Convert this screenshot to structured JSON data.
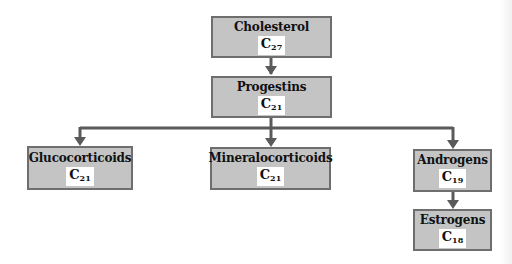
{
  "diagram": {
    "type": "steroid-hormone-biosynthesis-hierarchy",
    "colors": {
      "box_fill": "#c4c4c4",
      "box_border": "#6e6e6e",
      "arrow": "#5a5a5a",
      "formula_bg": "#ffffff"
    },
    "nodes": [
      {
        "id": "cholesterol",
        "name": "Cholesterol",
        "formula_letter": "C",
        "carbon_count": "27"
      },
      {
        "id": "progestins",
        "name": "Progestins",
        "formula_letter": "C",
        "carbon_count": "21"
      },
      {
        "id": "glucocorticoids",
        "name": "Glucocorticoids",
        "formula_letter": "C",
        "carbon_count": "21"
      },
      {
        "id": "mineralocorticoids",
        "name": "Mineralocorticoids",
        "formula_letter": "C",
        "carbon_count": "21"
      },
      {
        "id": "androgens",
        "name": "Androgens",
        "formula_letter": "C",
        "carbon_count": "19"
      },
      {
        "id": "estrogens",
        "name": "Estrogens",
        "formula_letter": "C",
        "carbon_count": "18"
      }
    ],
    "edges": [
      {
        "from": "cholesterol",
        "to": "progestins"
      },
      {
        "from": "progestins",
        "to": "glucocorticoids"
      },
      {
        "from": "progestins",
        "to": "mineralocorticoids"
      },
      {
        "from": "progestins",
        "to": "androgens"
      },
      {
        "from": "androgens",
        "to": "estrogens"
      }
    ]
  }
}
